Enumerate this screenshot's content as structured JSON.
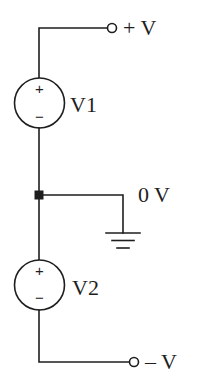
{
  "diagram": {
    "type": "circuit-schematic",
    "terminals": {
      "positive": {
        "label": "+ V"
      },
      "negative": {
        "label": "– V"
      }
    },
    "ground_node": {
      "label": "0 V"
    },
    "sources": [
      {
        "name": "V1",
        "plus": "+",
        "minus": "−"
      },
      {
        "name": "V2",
        "plus": "+",
        "minus": "−"
      }
    ],
    "colors": {
      "stroke": "#1e1e1e",
      "background": "#ffffff"
    }
  }
}
